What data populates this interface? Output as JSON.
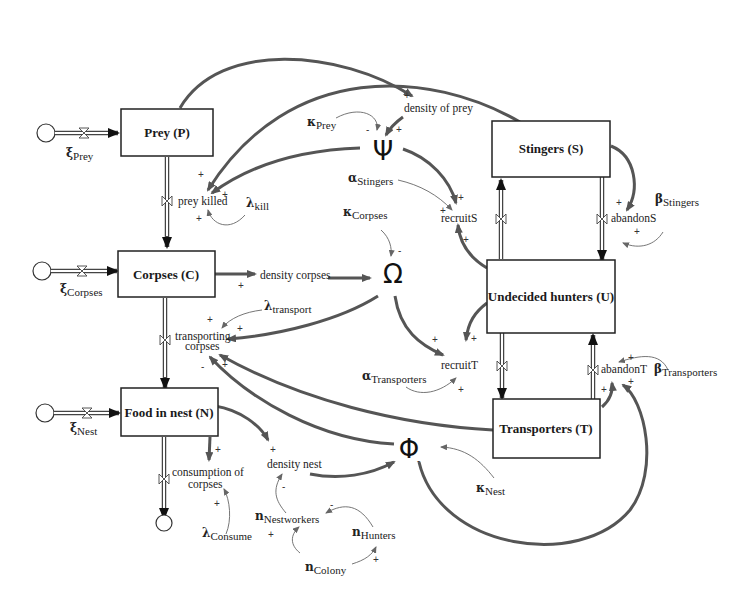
{
  "diagram": {
    "type": "stock-and-flow",
    "stocks": {
      "prey": "Prey (P)",
      "corpses": "Corpses (C)",
      "food": "Food in nest (N)",
      "stingers": "Stingers (S)",
      "undecided": "Undecided hunters (U)",
      "transporters": "Transporters (T)"
    },
    "flows": {
      "prey_killed": "prey killed",
      "transporting_1": "transporting",
      "transporting_2": "corpses",
      "consumption_1": "consumption of",
      "consumption_2": "corpses",
      "recruitS": "recruitS",
      "abandonS": "abandonS",
      "recruitT": "recruitT",
      "abandonT": "abandonT"
    },
    "auxiliaries": {
      "density_prey": "density of prey",
      "density_corpses": "density corpses",
      "density_nest": "density nest",
      "psi": "Ψ",
      "omega": "Ω",
      "phi": "Φ"
    },
    "parameters": {
      "xi_prey": {
        "greek": "ξ",
        "sub": "Prey"
      },
      "xi_corpses": {
        "greek": "ξ",
        "sub": "Corpses"
      },
      "xi_nest": {
        "greek": "ξ",
        "sub": "Nest"
      },
      "kappa_prey": {
        "greek": "κ",
        "sub": "Prey"
      },
      "kappa_corpses": {
        "greek": "κ",
        "sub": "Corpses"
      },
      "kappa_nest": {
        "greek": "κ",
        "sub": "Nest"
      },
      "alpha_stingers": {
        "greek": "α",
        "sub": "Stingers"
      },
      "alpha_transporters": {
        "greek": "α",
        "sub": "Transporters"
      },
      "beta_stingers": {
        "greek": "β",
        "sub": "Stingers"
      },
      "beta_transporters": {
        "greek": "β",
        "sub": "Transporters"
      },
      "lambda_kill": {
        "greek": "λ",
        "sub": "kill"
      },
      "lambda_transport": {
        "greek": "λ",
        "sub": "transport"
      },
      "lambda_consume": {
        "greek": "λ",
        "sub": "Consume"
      },
      "n_nestworkers": {
        "greek": "n",
        "sub": "Nestworkers"
      },
      "n_hunters": {
        "greek": "n",
        "sub": "Hunters"
      },
      "n_colony": {
        "greek": "n",
        "sub": "Colony"
      }
    },
    "polarity": {
      "plus": "+",
      "minus": "-"
    }
  }
}
